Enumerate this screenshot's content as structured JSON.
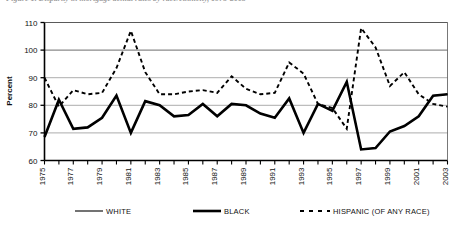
{
  "figure": {
    "caption": "Figure 1. Disparity in mortgage denial rates by race/ethnicity, 1975-2003"
  },
  "chart_data": {
    "type": "line",
    "title": "",
    "xlabel": "",
    "ylabel": "Percent",
    "ylim": [
      60,
      110
    ],
    "ytick_values": [
      60,
      70,
      80,
      90,
      100,
      110
    ],
    "ytick_labels": [
      "60",
      "70",
      "80",
      "90",
      "100",
      "110"
    ],
    "grid": true,
    "legend_position": "bottom",
    "x": [
      1975,
      1976,
      1977,
      1978,
      1979,
      1980,
      1981,
      1982,
      1983,
      1984,
      1985,
      1986,
      1987,
      1988,
      1989,
      1990,
      1991,
      1992,
      1993,
      1994,
      1995,
      1996,
      1997,
      1998,
      1999,
      2000,
      2001,
      2002,
      2003
    ],
    "xtick_labels": [
      "1975",
      "1977",
      "1979",
      "1981",
      "1983",
      "1985",
      "1987",
      "1989",
      "1991",
      "1993",
      "1995",
      "1997",
      "1999",
      "2001",
      "2003"
    ],
    "xtick_values": [
      1975,
      1977,
      1979,
      1981,
      1983,
      1985,
      1987,
      1989,
      1991,
      1993,
      1995,
      1997,
      1999,
      2001,
      2003
    ],
    "series": [
      {
        "name": "WHITE",
        "style": "solid-thin",
        "values": [
          68.5,
          82.0,
          71.5,
          72.0,
          75.5,
          83.5,
          70.0,
          81.5,
          80.0,
          76.0,
          76.5,
          80.5,
          76.0,
          80.5,
          80.0,
          77.0,
          75.5,
          82.5,
          70.0,
          80.5,
          78.0,
          88.5,
          64.0,
          64.5,
          70.5,
          72.5,
          76.0,
          83.5,
          84.0
        ]
      },
      {
        "name": "BLACK",
        "style": "solid-thick",
        "values": [
          68.5,
          82.0,
          71.5,
          72.0,
          75.5,
          83.5,
          70.0,
          81.5,
          80.0,
          76.0,
          76.5,
          80.5,
          76.0,
          80.5,
          80.0,
          77.0,
          75.5,
          82.5,
          70.0,
          80.5,
          78.0,
          88.5,
          64.0,
          64.5,
          70.5,
          72.5,
          76.0,
          83.5,
          84.0
        ]
      },
      {
        "name": "HISPANIC (OF ANY RACE)",
        "style": "dashed",
        "values": [
          90.0,
          79.5,
          85.5,
          84.0,
          84.5,
          93.5,
          107.0,
          92.0,
          84.0,
          84.0,
          85.0,
          85.5,
          84.5,
          90.5,
          86.0,
          84.0,
          84.5,
          95.5,
          91.5,
          80.5,
          79.0,
          71.5,
          108.0,
          101.0,
          87.0,
          92.0,
          84.0,
          80.5,
          79.5
        ]
      }
    ]
  },
  "legend": {
    "items": [
      {
        "label": "WHITE",
        "style": "solid-thin"
      },
      {
        "label": "BLACK",
        "style": "solid-thick"
      },
      {
        "label": "HISPANIC (OF ANY RACE)",
        "style": "dashed"
      }
    ]
  }
}
